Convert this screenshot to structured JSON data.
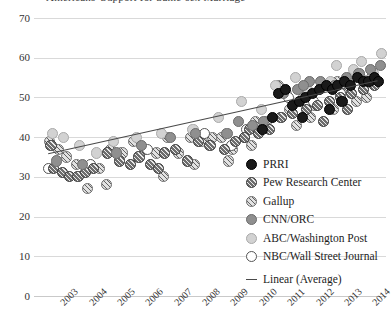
{
  "chart_title": "Americans' Support for Same-sex Marriage",
  "legend": {
    "items": [
      {
        "label": "PRRI",
        "marker": "solid-black-circle",
        "color": "#1a1a1a",
        "key_class": "m-prri"
      },
      {
        "label": "Pew Research Center",
        "marker": "dark-hatched-circle",
        "color": "#6e6e6e",
        "key_class": "m-pew"
      },
      {
        "label": "Gallup",
        "marker": "light-hatched-circle",
        "color": "#e2e2e2",
        "key_class": "m-gallup"
      },
      {
        "label": "CNN/ORC",
        "marker": "medium-gray-circle",
        "color": "#8f8f8f",
        "key_class": "m-cnn"
      },
      {
        "label": "ABC/Washington Post",
        "marker": "light-gray-circle",
        "color": "#d2d2d2",
        "key_class": "m-abc"
      },
      {
        "label": "NBC/Wall Street Journal",
        "marker": "open-white-circle",
        "color": "#ffffff",
        "key_class": "m-nbc"
      }
    ],
    "trend_label": "Linear (Average)",
    "trend_color": "#4a4a4a"
  },
  "chart_data": {
    "type": "scatter",
    "title": "Americans' Support for Same-sex Marriage",
    "xlabel": "",
    "ylabel": "",
    "xlim": [
      2002.5,
      2014.9
    ],
    "ylim": [
      0,
      70
    ],
    "yticks": [
      0,
      10,
      20,
      30,
      40,
      50,
      60,
      70
    ],
    "xticks": [
      "2003",
      "2004",
      "2005",
      "2006",
      "2007",
      "2008",
      "2009",
      "2010",
      "2011",
      "2012",
      "2013",
      "2014"
    ],
    "grid": "horizontal",
    "legend_position": "lower-right-inside",
    "trendline": {
      "name": "Linear (Average)",
      "type": "linear",
      "x": [
        2003.0,
        2014.6
      ],
      "y": [
        35.8,
        54.2
      ],
      "color": "#4a4a4a"
    },
    "series": [
      {
        "name": "PRRI",
        "color": "#1a1a1a",
        "points": [
          [
            2010.55,
            42.0
          ],
          [
            2010.9,
            45.0
          ],
          [
            2011.1,
            51.0
          ],
          [
            2011.35,
            52.0
          ],
          [
            2011.6,
            48.0
          ],
          [
            2011.85,
            49.0
          ],
          [
            2012.05,
            50.0
          ],
          [
            2012.3,
            51.0
          ],
          [
            2012.55,
            52.0
          ],
          [
            2012.8,
            53.0
          ],
          [
            2013.0,
            52.0
          ],
          [
            2013.2,
            53.0
          ],
          [
            2013.45,
            54.0
          ],
          [
            2013.65,
            53.0
          ],
          [
            2013.9,
            55.0
          ],
          [
            2014.1,
            54.0
          ],
          [
            2014.3,
            54.0
          ],
          [
            2014.5,
            55.0
          ],
          [
            2014.65,
            54.0
          ],
          [
            2012.9,
            47.0
          ],
          [
            2013.35,
            49.0
          ],
          [
            2011.95,
            45.0
          ]
        ]
      },
      {
        "name": "Pew Research Center",
        "color": "#6e6e6e",
        "points": [
          [
            2003.1,
            38.0
          ],
          [
            2003.2,
            32.0
          ],
          [
            2003.5,
            31.0
          ],
          [
            2003.75,
            30.0
          ],
          [
            2004.05,
            30.0
          ],
          [
            2004.3,
            31.0
          ],
          [
            2004.6,
            32.0
          ],
          [
            2005.1,
            36.0
          ],
          [
            2005.5,
            34.0
          ],
          [
            2005.9,
            33.0
          ],
          [
            2006.2,
            35.0
          ],
          [
            2006.6,
            33.0
          ],
          [
            2007.1,
            36.0
          ],
          [
            2007.5,
            37.0
          ],
          [
            2007.9,
            34.0
          ],
          [
            2008.3,
            39.0
          ],
          [
            2008.7,
            38.0
          ],
          [
            2009.2,
            37.0
          ],
          [
            2009.6,
            39.0
          ],
          [
            2010.1,
            42.0
          ],
          [
            2010.4,
            41.0
          ],
          [
            2010.8,
            42.0
          ],
          [
            2011.2,
            45.0
          ],
          [
            2011.6,
            46.0
          ],
          [
            2012.1,
            47.0
          ],
          [
            2012.5,
            48.0
          ],
          [
            2012.9,
            49.0
          ],
          [
            2013.3,
            50.0
          ],
          [
            2013.7,
            51.0
          ],
          [
            2014.1,
            52.0
          ],
          [
            2014.5,
            53.0
          ],
          [
            2006.9,
            32.0
          ],
          [
            2009.9,
            40.0
          ],
          [
            2012.7,
            44.0
          ],
          [
            2013.55,
            47.0
          ]
        ]
      },
      {
        "name": "Gallup",
        "color": "#e2e2e2",
        "points": [
          [
            2003.05,
            39.0
          ],
          [
            2003.35,
            37.0
          ],
          [
            2003.65,
            35.0
          ],
          [
            2004.0,
            33.0
          ],
          [
            2004.4,
            27.0
          ],
          [
            2004.8,
            32.0
          ],
          [
            2005.2,
            37.0
          ],
          [
            2005.6,
            36.0
          ],
          [
            2006.0,
            39.0
          ],
          [
            2006.4,
            37.0
          ],
          [
            2006.8,
            36.0
          ],
          [
            2007.2,
            40.0
          ],
          [
            2007.6,
            36.0
          ],
          [
            2008.0,
            40.0
          ],
          [
            2008.4,
            39.0
          ],
          [
            2008.8,
            40.0
          ],
          [
            2009.1,
            40.0
          ],
          [
            2009.5,
            37.0
          ],
          [
            2009.9,
            40.0
          ],
          [
            2010.3,
            44.0
          ],
          [
            2010.7,
            44.0
          ],
          [
            2011.1,
            53.0
          ],
          [
            2011.5,
            47.0
          ],
          [
            2012.0,
            50.0
          ],
          [
            2012.4,
            48.0
          ],
          [
            2012.8,
            53.0
          ],
          [
            2013.2,
            54.0
          ],
          [
            2013.6,
            52.0
          ],
          [
            2014.0,
            55.0
          ],
          [
            2014.4,
            55.0
          ],
          [
            2005.05,
            28.0
          ],
          [
            2007.05,
            30.0
          ],
          [
            2008.15,
            33.0
          ],
          [
            2009.35,
            34.0
          ],
          [
            2010.15,
            38.0
          ],
          [
            2011.75,
            43.0
          ],
          [
            2012.25,
            45.0
          ],
          [
            2013.05,
            47.0
          ],
          [
            2013.85,
            49.0
          ],
          [
            2014.2,
            50.0
          ]
        ]
      },
      {
        "name": "CNN/ORC",
        "color": "#8f8f8f",
        "points": [
          [
            2003.3,
            34.0
          ],
          [
            2004.2,
            33.0
          ],
          [
            2005.4,
            36.0
          ],
          [
            2006.3,
            38.0
          ],
          [
            2007.3,
            40.0
          ],
          [
            2008.2,
            41.0
          ],
          [
            2009.3,
            41.0
          ],
          [
            2010.2,
            43.0
          ],
          [
            2010.6,
            44.0
          ],
          [
            2011.3,
            51.0
          ],
          [
            2011.8,
            52.0
          ],
          [
            2012.2,
            54.0
          ],
          [
            2012.6,
            54.0
          ],
          [
            2013.1,
            53.0
          ],
          [
            2013.5,
            55.0
          ],
          [
            2013.95,
            56.0
          ],
          [
            2014.35,
            57.0
          ],
          [
            2014.7,
            58.0
          ],
          [
            2009.7,
            44.0
          ],
          [
            2012.0,
            53.0
          ]
        ]
      },
      {
        "name": "ABC/Washington Post",
        "color": "#d2d2d2",
        "points": [
          [
            2003.15,
            41.0
          ],
          [
            2003.55,
            40.0
          ],
          [
            2004.1,
            38.0
          ],
          [
            2004.7,
            36.0
          ],
          [
            2005.3,
            39.0
          ],
          [
            2006.1,
            40.0
          ],
          [
            2007.0,
            41.0
          ],
          [
            2008.1,
            42.0
          ],
          [
            2009.0,
            45.0
          ],
          [
            2009.8,
            49.0
          ],
          [
            2010.5,
            47.0
          ],
          [
            2011.0,
            53.0
          ],
          [
            2011.4,
            51.0
          ],
          [
            2012.15,
            52.0
          ],
          [
            2012.65,
            53.0
          ],
          [
            2013.15,
            58.0
          ],
          [
            2013.6,
            55.0
          ],
          [
            2014.05,
            59.0
          ],
          [
            2014.45,
            56.0
          ],
          [
            2014.75,
            61.0
          ],
          [
            2011.7,
            55.0
          ],
          [
            2012.95,
            54.0
          ],
          [
            2013.75,
            57.0
          ]
        ]
      },
      {
        "name": "NBC/Wall Street Journal",
        "color": "#ffffff",
        "points": [
          [
            2003.0,
            32.0
          ],
          [
            2004.5,
            33.0
          ],
          [
            2006.5,
            37.0
          ],
          [
            2008.5,
            41.0
          ],
          [
            2009.45,
            38.0
          ],
          [
            2010.0,
            42.0
          ],
          [
            2011.45,
            50.0
          ],
          [
            2012.35,
            49.0
          ],
          [
            2013.3,
            51.0
          ],
          [
            2014.15,
            53.0
          ]
        ]
      }
    ]
  }
}
